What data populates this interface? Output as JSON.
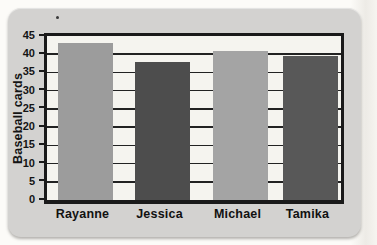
{
  "chart_data": {
    "type": "bar",
    "title": "",
    "xlabel": "",
    "ylabel": "Baseball cards",
    "categories": [
      "Rayanne",
      "Jessica",
      "Michael",
      "Tamika"
    ],
    "values": [
      43,
      38,
      41,
      39.5
    ],
    "bar_colors": [
      "#9c9c9c",
      "#4d4d4d",
      "#a4a4a4",
      "#585858"
    ],
    "yticks": [
      0,
      5,
      10,
      15,
      20,
      25,
      30,
      35,
      40,
      45
    ],
    "ylim": [
      0,
      45
    ],
    "grid": "horizontal-every-5",
    "legend": "none",
    "colors": {
      "card_background": "#d3d2d0",
      "plot_background": "#f5f4ef",
      "frame": "#1a1a1a",
      "gridline": "#222222",
      "text": "#141414",
      "page_background": "#fcfbf8"
    }
  }
}
